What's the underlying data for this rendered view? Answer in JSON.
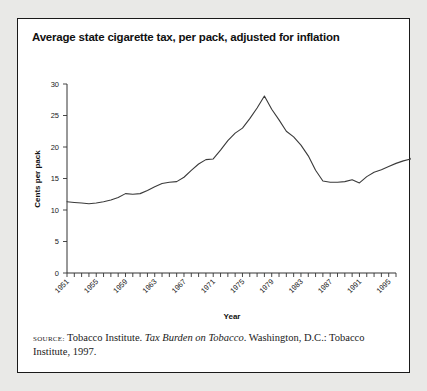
{
  "figure": {
    "title": "Average state cigarette tax, per pack, adjusted for inflation",
    "source_label": "Source:",
    "source_text_1": "Tobacco Institute.",
    "source_text_italic": "Tax Burden on Tobacco",
    "source_text_2": ". Washington, D.C.: Tobacco Institute, 1997.",
    "border_color": "#1a1a1a",
    "background_color": "#ffffff",
    "page_background": "#e9e9e7",
    "line_color": "#3a3a3a"
  },
  "chart_data": {
    "type": "line",
    "title": "Average state cigarette tax, per pack, adjusted for inflation",
    "xlabel": "Year",
    "ylabel": "Cents per pack",
    "xlim": [
      1951,
      1996
    ],
    "ylim": [
      0,
      30
    ],
    "yticks": [
      0,
      5,
      10,
      15,
      20,
      25,
      30
    ],
    "xticks_labeled": [
      1951,
      1955,
      1959,
      1963,
      1967,
      1971,
      1975,
      1979,
      1983,
      1987,
      1991,
      1995
    ],
    "xtick_interval_minor": 1,
    "grid": false,
    "legend": false,
    "x": [
      1951,
      1952,
      1953,
      1954,
      1955,
      1956,
      1957,
      1958,
      1959,
      1960,
      1961,
      1962,
      1963,
      1964,
      1965,
      1966,
      1967,
      1968,
      1969,
      1970,
      1971,
      1972,
      1973,
      1974,
      1975,
      1976,
      1977,
      1978,
      1979,
      1980,
      1981,
      1982,
      1983,
      1984,
      1985,
      1986,
      1987,
      1988,
      1989,
      1990,
      1991,
      1992,
      1993,
      1994,
      1995,
      1996
    ],
    "values": [
      11.3,
      11.2,
      11.1,
      11.0,
      11.1,
      11.3,
      11.6,
      12.0,
      12.6,
      12.5,
      12.6,
      13.1,
      13.7,
      14.2,
      14.4,
      14.5,
      15.2,
      16.3,
      17.3,
      18.0,
      18.1,
      19.5,
      21.0,
      22.2,
      23.0,
      24.5,
      26.2,
      28.1,
      26.0,
      24.3,
      22.5,
      21.6,
      20.3,
      18.6,
      16.3,
      14.6,
      14.4,
      14.4,
      14.5,
      14.8,
      14.3,
      15.3,
      16.0,
      16.4,
      16.9,
      17.4
    ],
    "values_late": [
      17.8,
      18.1,
      19.6,
      20.2,
      20.5
    ]
  },
  "axes": {
    "y_tick_labels": [
      "30",
      "25",
      "20",
      "15",
      "10",
      "5",
      "0"
    ],
    "x_tick_labels": [
      "1951",
      "1955",
      "1959",
      "1963",
      "1967",
      "1971",
      "1975",
      "1979",
      "1983",
      "1987",
      "1991",
      "1995"
    ],
    "x_axis_title": "Year",
    "y_axis_title": "Cents per pack"
  }
}
